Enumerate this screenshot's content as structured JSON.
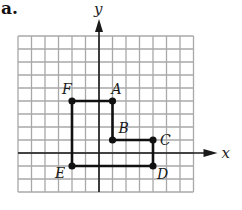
{
  "part_label": "a.",
  "axes": {
    "x_label": "x",
    "y_label": "y",
    "x_min": -6,
    "x_max": 7,
    "y_min": -3,
    "y_max": 9
  },
  "grid": {
    "left_px": 18,
    "top_px": 36,
    "cell_w_px": 13.5,
    "cell_h_px": 13.0,
    "line_color": "#a8a8a8",
    "axis_color": "#1a1a1a",
    "shape_color": "#111111"
  },
  "points": [
    {
      "label": "A",
      "x": 1,
      "y": 4,
      "label_dx": -1,
      "label_dy": -7
    },
    {
      "label": "B",
      "x": 1,
      "y": 1,
      "label_dx": 6,
      "label_dy": -7
    },
    {
      "label": "C",
      "x": 4,
      "y": 1,
      "label_dx": 7,
      "label_dy": 5
    },
    {
      "label": "D",
      "x": 4,
      "y": -1,
      "label_dx": 4,
      "label_dy": 13
    },
    {
      "label": "E",
      "x": -2,
      "y": -1,
      "label_dx": -17,
      "label_dy": 12
    },
    {
      "label": "F",
      "x": -2,
      "y": 4,
      "label_dx": -10,
      "label_dy": -7
    }
  ],
  "polygon_order": [
    "A",
    "B",
    "C",
    "D",
    "E",
    "F"
  ]
}
